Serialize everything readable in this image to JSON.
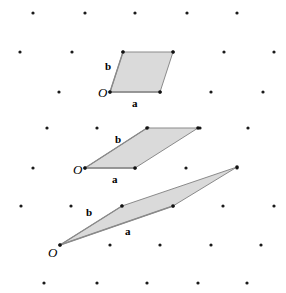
{
  "figure": {
    "width": 286,
    "height": 293,
    "background_color": "#ffffff",
    "lattice": {
      "dot_color": "#1a1a1a",
      "dot_radius": 1.6,
      "row_spacing": 39,
      "column_spacing": 51,
      "row_shift": -13,
      "points": [
        [
          33,
          13
        ],
        [
          85,
          13
        ],
        [
          135,
          13
        ],
        [
          187,
          13
        ],
        [
          237,
          13
        ],
        [
          20,
          52
        ],
        [
          72,
          52
        ],
        [
          123,
          52
        ],
        [
          173,
          52
        ],
        [
          224,
          52
        ],
        [
          274,
          52
        ],
        [
          59,
          92
        ],
        [
          110,
          92
        ],
        [
          160,
          92
        ],
        [
          211,
          92
        ],
        [
          263,
          92
        ],
        [
          47,
          128
        ],
        [
          97,
          128
        ],
        [
          148,
          128
        ],
        [
          200,
          128
        ],
        [
          248,
          128
        ],
        [
          33,
          168
        ],
        [
          85,
          168
        ],
        [
          135,
          168
        ],
        [
          186,
          168
        ],
        [
          237,
          168
        ],
        [
          21,
          206
        ],
        [
          71,
          206
        ],
        [
          122,
          206
        ],
        [
          173,
          206
        ],
        [
          223,
          206
        ],
        [
          274,
          206
        ],
        [
          60,
          245
        ],
        [
          110,
          245
        ],
        [
          160,
          245
        ],
        [
          211,
          245
        ],
        [
          261,
          245
        ],
        [
          44,
          283
        ],
        [
          97,
          283
        ],
        [
          147,
          283
        ],
        [
          198,
          283
        ],
        [
          247,
          283
        ]
      ]
    },
    "cells": [
      {
        "name": "unit-cell-top",
        "origin": [
          110,
          92
        ],
        "a_end": [
          160,
          92
        ],
        "b_end": [
          123,
          52
        ],
        "far": [
          173,
          52
        ],
        "origin_label": "O",
        "a_label": "a",
        "b_label": "b",
        "origin_label_pos": [
          98,
          97
        ],
        "a_label_pos": [
          132,
          107
        ],
        "b_label_pos": [
          105,
          70
        ],
        "fill_color": "#d4d4d4",
        "stroke_color": "#8a8a8a"
      },
      {
        "name": "unit-cell-middle",
        "origin": [
          85,
          168
        ],
        "a_end": [
          135,
          168
        ],
        "b_end": [
          147,
          128
        ],
        "far": [
          198,
          128
        ],
        "origin_label": "O",
        "a_label": "a",
        "b_label": "b",
        "origin_label_pos": [
          73,
          174
        ],
        "a_label_pos": [
          112,
          183
        ],
        "b_label_pos": [
          115,
          143
        ],
        "fill_color": "#d4d4d4",
        "stroke_color": "#8a8a8a"
      },
      {
        "name": "unit-cell-bottom",
        "origin": [
          60,
          245
        ],
        "a_end": [
          173,
          206
        ],
        "b_end": [
          122,
          206
        ],
        "far": [
          237,
          167
        ],
        "origin_label": "O",
        "a_label": "a",
        "b_label": "b",
        "origin_label_pos": [
          48,
          257
        ],
        "a_label_pos": [
          125,
          235
        ],
        "b_label_pos": [
          86,
          216
        ],
        "fill_color": "#d4d4d4",
        "stroke_color": "#8a8a8a"
      }
    ]
  }
}
